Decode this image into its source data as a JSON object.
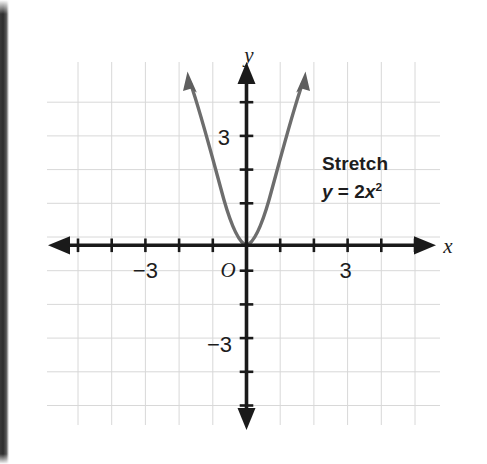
{
  "figure": {
    "kind": "coordinate-grid-graph",
    "background_color": "#ffffff",
    "grid_color": "#d6d6d6",
    "axis_color": "#1a1a1a",
    "curve_color": "#6d6d6d",
    "text_color": "#1d1d1d"
  },
  "axes": {
    "x_axis_label": "x",
    "y_axis_label": "y",
    "origin_label": "O",
    "x_ticks": [
      {
        "value": -3,
        "label": "−3"
      },
      {
        "value": 3,
        "label": "3"
      }
    ],
    "y_ticks": [
      {
        "value": 3,
        "label": "3"
      },
      {
        "value": -3,
        "label": "−3"
      }
    ],
    "xlim": [
      -5,
      5
    ],
    "ylim": [
      -4,
      5
    ],
    "grid": true
  },
  "annotation": {
    "title": "Stretch",
    "equation": "y = 2x²"
  },
  "chart_data": {
    "type": "line",
    "title": "Stretch",
    "xlabel": "x",
    "ylabel": "y",
    "xlim": [
      -5,
      5
    ],
    "ylim": [
      -4,
      5
    ],
    "grid": true,
    "legend": "none",
    "annotations": [
      "Stretch",
      "y = 2x²"
    ],
    "series": [
      {
        "name": "y = 2x²",
        "equation": "y = 2*x^2",
        "color": "#6d6d6d",
        "arrowheads": "both-ends",
        "x": [
          -1.7,
          -1.5,
          -1.25,
          -1.0,
          -0.75,
          -0.5,
          -0.25,
          0,
          0.25,
          0.5,
          0.75,
          1.0,
          1.25,
          1.5,
          1.7
        ],
        "y": [
          5.78,
          4.5,
          3.125,
          2.0,
          1.125,
          0.5,
          0.125,
          0,
          0.125,
          0.5,
          1.125,
          2.0,
          3.125,
          4.5,
          5.78
        ]
      }
    ],
    "x_tick_labels": [
      "−3",
      "3"
    ],
    "y_tick_labels": [
      "3",
      "−3"
    ]
  }
}
